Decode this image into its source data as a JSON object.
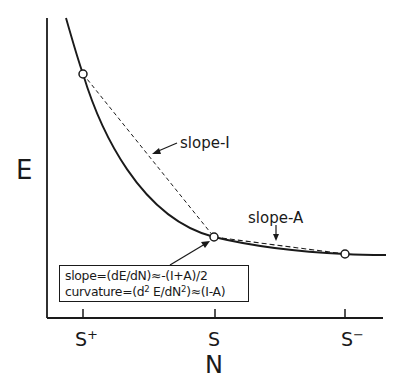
{
  "diagram": {
    "y_axis_label": "E",
    "x_axis_label": "N",
    "x_ticks": [
      {
        "base": "S",
        "sup": "+"
      },
      {
        "base": "S",
        "sup": ""
      },
      {
        "base": "S",
        "sup": "−"
      }
    ],
    "annotations": {
      "slope_I": "slope-I",
      "slope_A": "slope-A"
    },
    "formula_box": {
      "line1": "slope=(dE/dN)≈-(I+A)/2",
      "line2_prefix": "curvature=(d",
      "line2_sup1": "2",
      "line2_mid": " E/dN",
      "line2_sup2": "2",
      "line2_suffix": ")≈(I-A)"
    },
    "points": [
      {
        "name": "S+",
        "x": 83,
        "y": 74
      },
      {
        "name": "S",
        "x": 214,
        "y": 237
      },
      {
        "name": "S-",
        "x": 345,
        "y": 254
      }
    ],
    "colors": {
      "ink": "#1a1a1a",
      "background": "#ffffff"
    }
  }
}
